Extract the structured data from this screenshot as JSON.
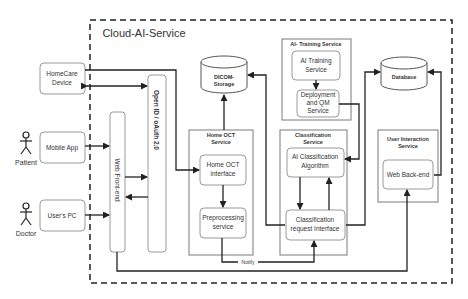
{
  "container": {
    "title": "Cloud-AI-Service"
  },
  "actors": {
    "patient": "Patient",
    "doctor": "Doctor"
  },
  "clients": {
    "homecare": [
      "HomeCare",
      "Device"
    ],
    "mobile": "Mobile App",
    "pc": "User's PC"
  },
  "bars": {
    "web_frontend": "Web Front-end",
    "openid": "Open ID / oAuth 2.0"
  },
  "storage": {
    "dicom": [
      "DICOM-",
      "Storage"
    ],
    "database": "Database"
  },
  "home_oct": {
    "title": [
      "Home OCT",
      "Service"
    ],
    "interface": [
      "Home OCT",
      "interface"
    ],
    "preprocessing": [
      "Preprocessing",
      "service"
    ]
  },
  "ai_training": {
    "title": "AI- Training Service",
    "training": [
      "AI Training",
      "Service"
    ],
    "deployment": [
      "Deployment",
      "and QM",
      "Service"
    ]
  },
  "classification": {
    "title": [
      "Classification",
      "Service"
    ],
    "algorithm": [
      "AI Classification",
      "Algorithm"
    ],
    "request": [
      "Classification",
      "request Interface"
    ]
  },
  "user_interaction": {
    "title": [
      "User Interaction",
      "Service"
    ],
    "backend": "Web Back-end"
  },
  "edges": {
    "notify": "Notify"
  }
}
